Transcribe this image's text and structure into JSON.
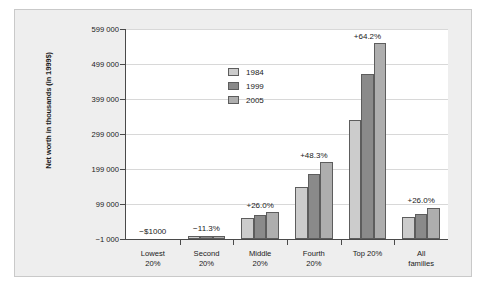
{
  "chart_data": {
    "type": "bar",
    "title": "",
    "subtitle": "",
    "xlabel": "",
    "ylabel": "Net worth in thousands (in 1999$)",
    "categories": [
      "Lowest\n20%",
      "Second\n20%",
      "Middle\n20%",
      "Fourth\n20%",
      "Top 20%",
      "All\nfamilies"
    ],
    "category_labels": [
      {
        "line1": "Lowest",
        "line2": "20%"
      },
      {
        "line1": "Second",
        "line2": "20%"
      },
      {
        "line1": "Middle",
        "line2": "20%"
      },
      {
        "line1": "Fourth",
        "line2": "20%"
      },
      {
        "line1": "Top 20%",
        "line2": ""
      },
      {
        "line1": "All",
        "line2": "families"
      }
    ],
    "series": [
      {
        "name": "1984",
        "color": "#cccccc",
        "values": [
          0,
          8000,
          60000,
          148000,
          340000,
          62000
        ]
      },
      {
        "name": "1999",
        "color": "#8a8a8a",
        "values": [
          0,
          8500,
          68000,
          185000,
          470000,
          70000
        ]
      },
      {
        "name": "2005",
        "color": "#aeaeae",
        "values": [
          0,
          8800,
          76000,
          218000,
          558000,
          88000
        ]
      }
    ],
    "ylim": [
      -1000,
      599000
    ],
    "yticks": [
      -1000,
      99000,
      199000,
      299000,
      399000,
      499000,
      599000
    ],
    "ytick_labels": [
      "−1 000",
      "99 000",
      "199 000",
      "299 000",
      "399 000",
      "499 000",
      "599 000"
    ],
    "grid": true,
    "grid_axis": "y",
    "legend_position": "upper center",
    "annotations": [
      {
        "category": "Lowest 20%",
        "text": "−$1000"
      },
      {
        "category": "Second 20%",
        "text": "−11.3%"
      },
      {
        "category": "Middle 20%",
        "text": "+26.0%"
      },
      {
        "category": "Fourth 20%",
        "text": "+48.3%"
      },
      {
        "category": "Top 20%",
        "text": "+64.2%"
      },
      {
        "category": "All families",
        "text": "+26.0%"
      }
    ]
  },
  "legend": {
    "items": [
      {
        "label": "1984"
      },
      {
        "label": "1999"
      },
      {
        "label": "2005"
      }
    ]
  }
}
